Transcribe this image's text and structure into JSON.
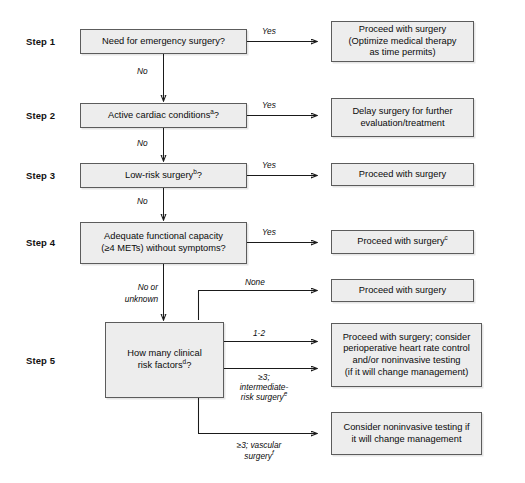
{
  "figure": {
    "type": "clinical-decision-flowchart"
  },
  "steps": [
    {
      "id": "step1",
      "label": "Step 1"
    },
    {
      "id": "step2",
      "label": "Step 2"
    },
    {
      "id": "step3",
      "label": "Step 3"
    },
    {
      "id": "step4",
      "label": "Step 4"
    },
    {
      "id": "step5",
      "label": "Step 5"
    }
  ],
  "decisions": [
    {
      "id": "d1",
      "text": "Need for emergency surgery?",
      "sup": ""
    },
    {
      "id": "d2",
      "text": "Active cardiac conditions",
      "sup": "a",
      "tail": "?"
    },
    {
      "id": "d3",
      "text": "Low-risk surgery",
      "sup": "b",
      "tail": "?"
    },
    {
      "id": "d4",
      "line1": "Adequate functional capacity",
      "line2": "(≥4 METs) without symptoms?"
    },
    {
      "id": "d5",
      "line1": "How many clinical",
      "line2": "risk factors",
      "sup": "d",
      "tail": "?"
    }
  ],
  "outcomes": [
    {
      "id": "o1",
      "lines": [
        "Proceed with surgery",
        "(Optimize medical therapy",
        "as time permits)"
      ]
    },
    {
      "id": "o2",
      "lines": [
        "Delay surgery for further",
        "evaluation/treatment"
      ]
    },
    {
      "id": "o3",
      "lines": [
        "Proceed with surgery"
      ]
    },
    {
      "id": "o4",
      "lines": [
        "Proceed with surgery"
      ],
      "sup": "c"
    },
    {
      "id": "o5",
      "lines": [
        "Proceed with surgery"
      ]
    },
    {
      "id": "o6",
      "lines": [
        "Proceed with surgery; consider",
        "perioperative heart rate control",
        "and/or noninvasive testing",
        "(if it will change management)"
      ]
    },
    {
      "id": "o7",
      "lines": [
        "Consider noninvasive testing if",
        "it will change management"
      ]
    }
  ],
  "edge_labels": {
    "yes1": "Yes",
    "yes2": "Yes",
    "yes3": "Yes",
    "yes4": "Yes",
    "no1": "No",
    "no2": "No",
    "no3": "No",
    "no_or_unknown_l1": "No or",
    "no_or_unknown_l2": "unknown",
    "none": "None",
    "one_two": "1-2",
    "ge3_interm_l1": "≥3;",
    "ge3_interm_l2": "intermediate-",
    "ge3_interm_l3": "risk surgery",
    "ge3_interm_sup": "e",
    "ge3_vasc_l1": "≥3; vascular",
    "ge3_vasc_l2": "surgery",
    "ge3_vasc_sup": "f"
  },
  "colors": {
    "box_fill": "#ededed",
    "box_border": "#5c5c5c",
    "line": "#1a1a1a",
    "text": "#0b0b0b",
    "background": "#ffffff"
  }
}
